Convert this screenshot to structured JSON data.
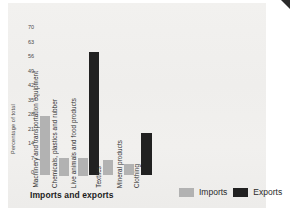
{
  "page": {
    "title": "Imports and exports"
  },
  "colors": {
    "imports": "#b2b2b2",
    "exports": "#212121",
    "page_background": "#f0efed",
    "text": "#3a3a3a"
  },
  "chart_data": {
    "type": "bar",
    "title": "Imports and exports",
    "xlabel": "",
    "ylabel": "Percentage of total",
    "ylim": [
      0,
      70
    ],
    "yticks": [
      0,
      7,
      14,
      21,
      28,
      35,
      42,
      49,
      56,
      63,
      70
    ],
    "grid": false,
    "legend_position": "bottom-right",
    "categories": [
      "Machinery and transportation equipment",
      "Chemicals, plastics and rubber",
      "Live animals and food products",
      "Textiles",
      "Mineral products",
      "Clothing"
    ],
    "series": [
      {
        "name": "Imports",
        "color": "#b2b2b2",
        "values": [
          27,
          7,
          7,
          6,
          4,
          null
        ]
      },
      {
        "name": "Exports",
        "color": "#212121",
        "values": [
          null,
          null,
          58,
          null,
          null,
          19
        ]
      }
    ]
  }
}
